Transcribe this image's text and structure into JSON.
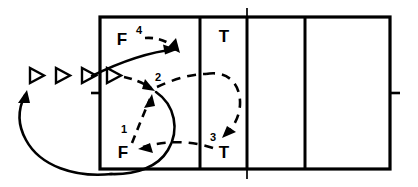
{
  "diagram": {
    "colors": {
      "ink": "#000000",
      "background": "#ffffff"
    },
    "court": {
      "outline": {
        "x": 100,
        "y": 17,
        "width": 290,
        "height": 152
      },
      "vertical_lines": [
        {
          "name": "attack-line-left",
          "x": 200
        },
        {
          "name": "center-line",
          "x": 247
        },
        {
          "name": "attack-line-right",
          "x": 305
        }
      ],
      "ticks": [
        {
          "name": "left-sideline-tick",
          "x1": 92,
          "y1": 93,
          "x2": 100,
          "y2": 93
        },
        {
          "name": "right-sideline-tick",
          "x1": 390,
          "y1": 93,
          "x2": 399,
          "y2": 93
        },
        {
          "name": "center-line-tick-top",
          "x1": 247,
          "y1": 9,
          "x2": 247,
          "y2": 17
        },
        {
          "name": "center-line-tick-bottom",
          "x1": 247,
          "y1": 169,
          "x2": 247,
          "y2": 178
        }
      ]
    },
    "labels": [
      {
        "name": "label-feeder-top",
        "text": "F",
        "x": 122,
        "y": 45,
        "size": "main"
      },
      {
        "name": "label-step-4",
        "text": "4",
        "x": 139,
        "y": 34,
        "size": "sup"
      },
      {
        "name": "label-step-2",
        "text": "2",
        "x": 154,
        "y": 80,
        "size": "step"
      },
      {
        "name": "label-step-1",
        "text": "1",
        "x": 122,
        "y": 131,
        "size": "step"
      },
      {
        "name": "label-feeder-bottom",
        "text": "F",
        "x": 121,
        "y": 155,
        "size": "main"
      },
      {
        "name": "label-step-3",
        "text": "3",
        "x": 212,
        "y": 140,
        "size": "step"
      },
      {
        "name": "label-target-top",
        "text": "T",
        "x": 223,
        "y": 41,
        "size": "main"
      },
      {
        "name": "label-target-bottom",
        "text": "T",
        "x": 223,
        "y": 157,
        "size": "main"
      }
    ],
    "player_markers": [
      {
        "name": "player-marker-1",
        "x": 34,
        "y": 75
      },
      {
        "name": "player-marker-2",
        "x": 60,
        "y": 75
      },
      {
        "name": "player-marker-3",
        "x": 86,
        "y": 75
      },
      {
        "name": "player-marker-4",
        "x": 111,
        "y": 75
      }
    ],
    "legend": {
      "feeder": "F",
      "target": "T",
      "step_order": [
        "1",
        "2",
        "3",
        "4"
      ]
    }
  }
}
